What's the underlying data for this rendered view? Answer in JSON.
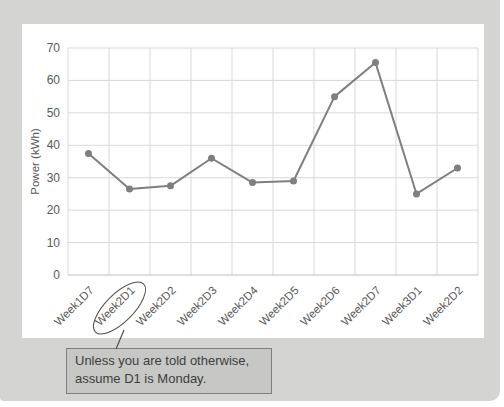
{
  "chart_data": {
    "type": "line",
    "title": "",
    "xlabel": "",
    "ylabel": "Power (kWh)",
    "categories": [
      "Week1D7",
      "Week2D1",
      "Week2D2",
      "Week2D3",
      "Week2D4",
      "Week2D5",
      "Week2D6",
      "Week2D7",
      "Week3D1",
      "Week2D2"
    ],
    "values": [
      37.5,
      26.5,
      27.5,
      36,
      28.5,
      29,
      55,
      65.5,
      25,
      33
    ],
    "ylim": [
      0,
      70
    ],
    "yticks": [
      0,
      10,
      20,
      30,
      40,
      50,
      60,
      70
    ],
    "grid": "both",
    "legend": "none"
  },
  "annotation": {
    "circled_category": "Week2D1",
    "circled_index": 1,
    "callout_lines": [
      "Unless you are told otherwise,",
      "assume D1 is Monday."
    ]
  },
  "colors": {
    "page_bg": "#ffffff",
    "panel_bg": "#d4d5d2",
    "card_bg": "#ffffff",
    "gridline": "#d9d9d9",
    "axis_line": "#bfbfbf",
    "tick_label": "#595959",
    "series_line": "#7f7f7f",
    "marker_fill": "#7f7f7f",
    "ellipse_stroke": "#4f4f4f",
    "leader_line": "#4f4f4f",
    "callout_bg": "#c7c8c5",
    "callout_border": "#7f7f7f",
    "callout_text": "#3d3d3d"
  }
}
